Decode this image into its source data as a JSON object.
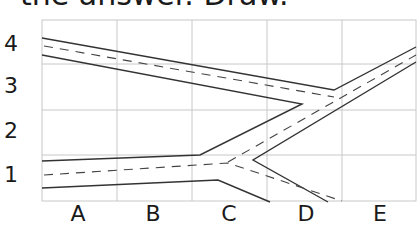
{
  "header": {
    "text": "the answer. Draw."
  },
  "grid": {
    "columns": [
      "A",
      "B",
      "C",
      "D",
      "E"
    ],
    "rows": [
      "4",
      "3",
      "2",
      "1"
    ],
    "line_color": "#c8c8c8",
    "road_color": "#333333"
  },
  "diagram": {
    "type": "road-map-grid"
  }
}
